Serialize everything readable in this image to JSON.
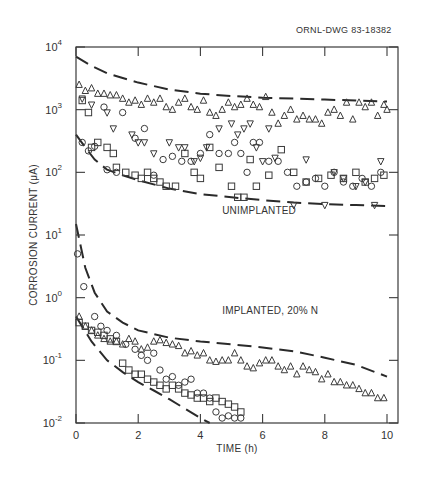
{
  "figure": {
    "drawing_id": "ORNL-DWG 83-18382"
  },
  "chart_data": {
    "type": "scatter",
    "title": "",
    "xlabel": "TIME (h)",
    "ylabel": "CORROSION CURRENT (μA)",
    "xlim": [
      0,
      10.3
    ],
    "ylim": [
      0.01,
      10000
    ],
    "yscale": "log",
    "grid": false,
    "x_ticks": [
      0,
      2,
      4,
      6,
      8,
      10
    ],
    "x_tick_labels": [
      "0",
      "2",
      "4",
      "6",
      "8",
      "10"
    ],
    "y_ticks": [
      0.01,
      0.1,
      1,
      10,
      100,
      1000,
      10000
    ],
    "y_tick_labels": [
      {
        "base": "10",
        "exp": "-2"
      },
      {
        "base": "10",
        "exp": "-1"
      },
      {
        "base": "10",
        "exp": "0"
      },
      {
        "base": "10",
        "exp": "1"
      },
      {
        "base": "10",
        "exp": "2"
      },
      {
        "base": "10",
        "exp": "3"
      },
      {
        "base": "10",
        "exp": "4"
      }
    ],
    "annotations": [
      {
        "text": "UNIMPLANTED",
        "x": 4.7,
        "y": 22
      },
      {
        "text": "IMPLANTED, 20% N",
        "x": 4.7,
        "y": 0.55
      }
    ],
    "series": [
      {
        "name": "Unimplanted - triangle",
        "marker": "triangle",
        "x": [
          0.1,
          0.3,
          0.5,
          0.7,
          0.9,
          1.1,
          1.3,
          1.5,
          1.7,
          1.9,
          2.1,
          2.3,
          2.5,
          2.7,
          2.9,
          3.1,
          3.3,
          3.5,
          3.7,
          3.9,
          4.1,
          4.3,
          4.5,
          4.7,
          4.9,
          5.1,
          5.3,
          5.5,
          5.7,
          5.9,
          6.1,
          6.3,
          6.5,
          6.7,
          6.9,
          7.1,
          7.3,
          7.5,
          7.7,
          7.9,
          8.1,
          8.3,
          8.5,
          8.7,
          8.9,
          9.1,
          9.3,
          9.5,
          9.7,
          9.9,
          10.0
        ],
        "y": [
          2500,
          2000,
          2200,
          1800,
          1800,
          1700,
          1700,
          1500,
          1300,
          1400,
          1200,
          1500,
          1300,
          1500,
          1100,
          1000,
          1300,
          1500,
          1100,
          1000,
          1400,
          900,
          800,
          1000,
          1300,
          1100,
          1200,
          1500,
          1200,
          1100,
          1600,
          900,
          600,
          800,
          1000,
          700,
          800,
          700,
          700,
          600,
          900,
          1000,
          800,
          1300,
          700,
          1300,
          1100,
          1300,
          800,
          1200,
          1000
        ]
      },
      {
        "name": "Unimplanted - inverted triangle",
        "marker": "triangle-down",
        "x": [
          0.2,
          0.5,
          1.0,
          1.2,
          1.8,
          2.0,
          2.2,
          2.5,
          3.0,
          3.3,
          3.5,
          3.8,
          4.0,
          4.2,
          4.6,
          5.0,
          5.2,
          5.4,
          5.6,
          5.8,
          6.0,
          6.2,
          6.4,
          7.0,
          7.4,
          8.0,
          8.3,
          8.6,
          9.0,
          9.3,
          9.6,
          9.8
        ],
        "y": [
          1500,
          1200,
          900,
          500,
          400,
          300,
          300,
          200,
          300,
          250,
          250,
          150,
          170,
          250,
          500,
          600,
          400,
          500,
          600,
          250,
          150,
          500,
          170,
          30,
          160,
          30,
          100,
          80,
          60,
          70,
          30,
          150
        ]
      },
      {
        "name": "Unimplanted - circle",
        "marker": "circle",
        "x": [
          0.2,
          0.4,
          0.6,
          0.9,
          1.0,
          1.3,
          1.5,
          1.9,
          2.2,
          2.5,
          2.8,
          3.1,
          3.4,
          3.7,
          4.0,
          4.3,
          4.6,
          4.9,
          5.1,
          5.3,
          5.5,
          5.7,
          5.9,
          6.2,
          6.5,
          6.8,
          7.1,
          7.4,
          7.7,
          8.0,
          8.3,
          8.6,
          8.9,
          9.2,
          9.5,
          9.8
        ],
        "y": [
          300,
          220,
          260,
          1100,
          110,
          100,
          900,
          350,
          500,
          90,
          160,
          180,
          150,
          150,
          200,
          400,
          200,
          200,
          300,
          200,
          100,
          300,
          300,
          150,
          150,
          100,
          60,
          70,
          80,
          60,
          100,
          70,
          60,
          80,
          60,
          100
        ]
      },
      {
        "name": "Unimplanted - square",
        "marker": "square",
        "x": [
          0.2,
          0.4,
          0.5,
          0.7,
          1.0,
          1.2,
          1.3,
          1.6,
          1.9,
          2.1,
          2.3,
          2.5,
          2.7,
          2.9,
          3.2,
          3.5,
          3.8,
          4.0,
          4.3,
          4.6,
          5.0,
          5.2,
          5.4,
          5.6,
          5.8,
          6.2,
          6.6,
          7.0,
          7.4,
          7.8,
          8.2,
          8.6,
          9.0,
          9.3,
          9.6,
          9.9
        ],
        "y": [
          1400,
          900,
          250,
          300,
          250,
          200,
          120,
          100,
          90,
          80,
          100,
          80,
          70,
          60,
          60,
          200,
          100,
          80,
          250,
          120,
          60,
          40,
          40,
          160,
          60,
          90,
          230,
          100,
          70,
          80,
          90,
          80,
          100,
          70,
          80,
          90
        ]
      },
      {
        "name": "Implanted 20% N - triangle",
        "marker": "triangle",
        "x": [
          0.1,
          0.3,
          0.5,
          0.7,
          0.9,
          1.1,
          1.3,
          1.5,
          1.7,
          1.9,
          2.1,
          2.3,
          2.5,
          2.7,
          2.9,
          3.1,
          3.3,
          3.5,
          3.7,
          3.9,
          4.1,
          4.3,
          4.5,
          4.7,
          4.9,
          5.1,
          5.3,
          5.5,
          5.7,
          5.9,
          6.1,
          6.3,
          6.5,
          6.7,
          6.9,
          7.1,
          7.3,
          7.5,
          7.7,
          7.9,
          8.1,
          8.3,
          8.5,
          8.7,
          8.9,
          9.1,
          9.3,
          9.5,
          9.7,
          9.9
        ],
        "y": [
          0.5,
          0.35,
          0.3,
          0.25,
          0.22,
          0.2,
          0.2,
          0.18,
          0.22,
          0.2,
          0.15,
          0.16,
          0.2,
          0.21,
          0.19,
          0.18,
          0.17,
          0.13,
          0.14,
          0.12,
          0.13,
          0.1,
          0.095,
          0.1,
          0.1,
          0.13,
          0.1,
          0.08,
          0.075,
          0.09,
          0.1,
          0.1,
          0.08,
          0.07,
          0.08,
          0.06,
          0.08,
          0.07,
          0.065,
          0.05,
          0.06,
          0.045,
          0.045,
          0.04,
          0.04,
          0.035,
          0.03,
          0.03,
          0.025,
          0.025
        ]
      },
      {
        "name": "Implanted 20% N - circle",
        "marker": "circle",
        "x": [
          0.05,
          0.25,
          0.6,
          0.8,
          1.0,
          1.3,
          1.6,
          1.9,
          2.1,
          2.3,
          2.5,
          2.7,
          2.9,
          3.1,
          3.3,
          3.5,
          3.7,
          3.9,
          4.1,
          4.3,
          4.5,
          4.7,
          4.9,
          5.1,
          5.3
        ],
        "y": [
          5,
          1.5,
          0.5,
          0.35,
          0.3,
          0.25,
          0.18,
          0.15,
          0.12,
          0.1,
          0.13,
          0.07,
          0.05,
          0.055,
          0.04,
          0.045,
          0.05,
          0.03,
          0.03,
          0.025,
          0.015,
          0.012,
          0.013,
          0.012,
          0.012
        ]
      },
      {
        "name": "Implanted 20% N - square",
        "marker": "square",
        "x": [
          0.1,
          0.3,
          0.5,
          0.7,
          0.9,
          1.1,
          1.3,
          1.5,
          1.7,
          1.9,
          2.1,
          2.3,
          2.5,
          2.7,
          2.9,
          3.1,
          3.3,
          3.5,
          3.7,
          3.9,
          4.1,
          4.3,
          4.5,
          4.7,
          4.9,
          5.1,
          5.3
        ],
        "y": [
          0.4,
          0.35,
          0.3,
          0.28,
          0.25,
          0.22,
          0.2,
          0.09,
          0.07,
          0.06,
          0.06,
          0.05,
          0.045,
          0.04,
          0.035,
          0.04,
          0.035,
          0.03,
          0.028,
          0.025,
          0.025,
          0.022,
          0.025,
          0.022,
          0.02,
          0.018,
          0.015
        ]
      }
    ],
    "fit_curves": [
      {
        "name": "Unimplanted upper bound",
        "style": "dashed",
        "x": [
          0,
          0.5,
          1,
          1.5,
          2,
          3,
          4,
          5,
          6,
          7,
          8,
          9,
          10
        ],
        "y": [
          7000,
          5000,
          3800,
          3200,
          2700,
          2100,
          1800,
          1650,
          1550,
          1500,
          1450,
          1400,
          1350
        ]
      },
      {
        "name": "Unimplanted lower bound",
        "style": "dashed",
        "x": [
          0,
          0.3,
          0.6,
          1,
          1.5,
          2,
          3,
          4,
          5,
          6,
          7,
          8,
          9,
          10
        ],
        "y": [
          400,
          250,
          160,
          110,
          90,
          75,
          55,
          45,
          40,
          36,
          33,
          31,
          30,
          29
        ]
      },
      {
        "name": "Implanted upper bound",
        "style": "dashed",
        "x": [
          0,
          0.3,
          0.6,
          1,
          1.5,
          2,
          3,
          4,
          5,
          6,
          7,
          8,
          9,
          10
        ],
        "y": [
          15,
          3,
          1.2,
          0.6,
          0.4,
          0.3,
          0.23,
          0.2,
          0.18,
          0.16,
          0.14,
          0.11,
          0.085,
          0.055
        ]
      },
      {
        "name": "Implanted lower bound",
        "style": "dashed",
        "x": [
          0,
          0.5,
          1,
          1.5,
          2,
          2.5,
          3,
          3.5,
          4,
          4.3
        ],
        "y": [
          0.5,
          0.2,
          0.1,
          0.065,
          0.045,
          0.033,
          0.024,
          0.017,
          0.012,
          0.01
        ]
      }
    ]
  }
}
